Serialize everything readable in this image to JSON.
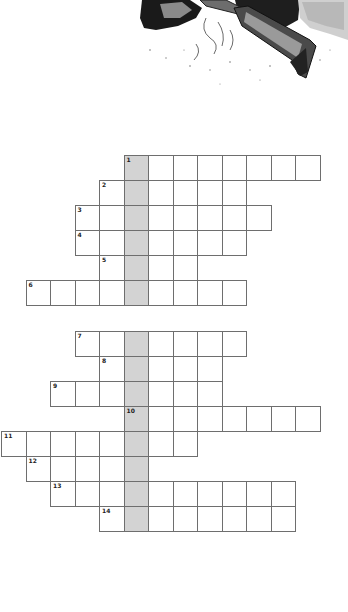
{
  "puzzle": {
    "cell_size": 24.5,
    "origin_x": 1,
    "shaded_column": 5,
    "shade_color": "#d3d3d3",
    "line_color": "#6e6e6e",
    "entries": [
      {
        "number": "1",
        "top": 155,
        "start_col": 5,
        "end_col": 12
      },
      {
        "number": "2",
        "top": 180,
        "start_col": 4,
        "end_col": 9
      },
      {
        "number": "3",
        "top": 205,
        "start_col": 3,
        "end_col": 10
      },
      {
        "number": "4",
        "top": 230,
        "start_col": 3,
        "end_col": 9
      },
      {
        "number": "5",
        "top": 255,
        "start_col": 4,
        "end_col": 7
      },
      {
        "number": "6",
        "top": 280,
        "start_col": 1,
        "end_col": 9
      },
      {
        "number": "7",
        "top": 331,
        "start_col": 3,
        "end_col": 9
      },
      {
        "number": "8",
        "top": 356,
        "start_col": 4,
        "end_col": 8
      },
      {
        "number": "9",
        "top": 381,
        "start_col": 2,
        "end_col": 8
      },
      {
        "number": "10",
        "top": 406,
        "start_col": 5,
        "end_col": 12
      },
      {
        "number": "11",
        "top": 431,
        "start_col": 0,
        "end_col": 7
      },
      {
        "number": "12",
        "top": 456,
        "start_col": 1,
        "end_col": 5
      },
      {
        "number": "13",
        "top": 481,
        "start_col": 2,
        "end_col": 11
      },
      {
        "number": "14",
        "top": 506,
        "start_col": 4,
        "end_col": 11
      }
    ]
  },
  "illustration": {
    "icon": "engraving-hunter-with-rifle-icon"
  }
}
